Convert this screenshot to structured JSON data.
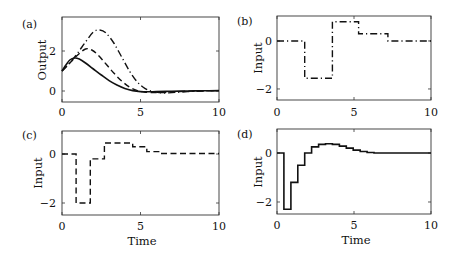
{
  "chart_data": [
    {
      "panel": "(a)",
      "type": "line",
      "xlabel": "",
      "ylabel": "Output",
      "xlim": [
        0,
        10
      ],
      "ylim": [
        -0.55,
        3.7
      ],
      "xticks": [
        "0",
        "5",
        "10"
      ],
      "yticks": [
        "0",
        "2"
      ],
      "series": [
        {
          "name": "solid",
          "style": "solid",
          "x": [
            0,
            0.25,
            0.5,
            0.8,
            1.1,
            1.5,
            2,
            2.5,
            3,
            3.5,
            4,
            4.5,
            5,
            5.5,
            6,
            7,
            8,
            9,
            10
          ],
          "y": [
            1.0,
            1.3,
            1.55,
            1.65,
            1.6,
            1.4,
            1.1,
            0.8,
            0.52,
            0.3,
            0.13,
            0.02,
            -0.03,
            -0.04,
            -0.03,
            -0.01,
            0.0,
            0.01,
            0.02
          ]
        },
        {
          "name": "dashed",
          "style": "dashed",
          "x": [
            0,
            0.5,
            1.0,
            1.5,
            1.9,
            2.3,
            2.8,
            3.3,
            3.8,
            4.3,
            4.8,
            5.3,
            6,
            7,
            8,
            9,
            10
          ],
          "y": [
            1.0,
            1.4,
            1.8,
            2.1,
            2.05,
            1.8,
            1.35,
            0.9,
            0.5,
            0.2,
            0.02,
            -0.06,
            -0.08,
            -0.05,
            -0.01,
            0.01,
            0.02
          ]
        },
        {
          "name": "dash-dot",
          "style": "dashdot",
          "x": [
            0,
            0.5,
            1.0,
            1.5,
            2.0,
            2.4,
            2.8,
            3.3,
            3.8,
            4.3,
            4.8,
            5.3,
            5.8,
            6.5,
            7,
            8,
            9,
            10
          ],
          "y": [
            1.0,
            1.4,
            1.9,
            2.45,
            2.95,
            3.05,
            2.9,
            2.4,
            1.7,
            1.0,
            0.45,
            0.12,
            -0.02,
            -0.1,
            -0.08,
            -0.03,
            0.0,
            0.02
          ]
        }
      ]
    },
    {
      "panel": "(b)",
      "type": "line",
      "xlabel": "",
      "ylabel": "Input",
      "xlim": [
        0,
        10
      ],
      "ylim": [
        -2.46,
        1.04
      ],
      "xticks": [
        "0",
        "5",
        "10"
      ],
      "yticks": [
        "0",
        "-2"
      ],
      "series": [
        {
          "name": "dash-dot",
          "style": "dashdot",
          "step": true,
          "x": [
            0,
            1.8,
            3.6,
            5.3,
            7.2,
            10
          ],
          "y": [
            0,
            -1.55,
            0.8,
            0.3,
            0,
            0
          ]
        }
      ]
    },
    {
      "panel": "(c)",
      "type": "line",
      "xlabel": "Time",
      "ylabel": "Input",
      "xlim": [
        0,
        10
      ],
      "ylim": [
        -2.49,
        0.94
      ],
      "xticks": [
        "0",
        "5",
        "10"
      ],
      "yticks": [
        "0",
        "-2"
      ],
      "series": [
        {
          "name": "dashed",
          "style": "dashed",
          "step": true,
          "x": [
            0,
            0.9,
            1.8,
            2.7,
            4.5,
            5.4,
            6.3,
            10
          ],
          "y": [
            0,
            -2.0,
            -0.2,
            0.45,
            0.3,
            0.1,
            0.02,
            0.02
          ]
        }
      ]
    },
    {
      "panel": "(d)",
      "type": "line",
      "xlabel": "Time",
      "ylabel": "Input",
      "xlim": [
        0,
        10
      ],
      "ylim": [
        -2.49,
        0.98
      ],
      "xticks": [
        "0",
        "5",
        "10"
      ],
      "yticks": [
        "0",
        "-2"
      ],
      "series": [
        {
          "name": "solid",
          "style": "solid",
          "step": true,
          "x": [
            0,
            0.45,
            0.9,
            1.35,
            1.8,
            2.25,
            2.7,
            3.15,
            3.6,
            4.05,
            4.5,
            4.95,
            5.4,
            5.85,
            6.3,
            6.75,
            10
          ],
          "y": [
            0,
            -2.3,
            -1.2,
            -0.5,
            0.0,
            0.25,
            0.35,
            0.38,
            0.35,
            0.28,
            0.2,
            0.12,
            0.06,
            0.02,
            0.0,
            0.0,
            0.0
          ]
        }
      ]
    }
  ],
  "panels": {
    "a": {
      "label": "(a)",
      "ylabel": "Output",
      "xticks": [
        "0",
        "5",
        "10"
      ],
      "yticks": [
        "0",
        "2"
      ]
    },
    "b": {
      "label": "(b)",
      "ylabel": "Input",
      "xticks": [
        "0",
        "5",
        "10"
      ],
      "yticks": [
        "0",
        "−2"
      ]
    },
    "c": {
      "label": "(c)",
      "ylabel": "Input",
      "xlabel": "Time",
      "xticks": [
        "0",
        "5",
        "10"
      ],
      "yticks": [
        "0",
        "−2"
      ]
    },
    "d": {
      "label": "(d)",
      "ylabel": "Input",
      "xlabel": "Time",
      "xticks": [
        "0",
        "5",
        "10"
      ],
      "yticks": [
        "0",
        "−2"
      ]
    }
  }
}
